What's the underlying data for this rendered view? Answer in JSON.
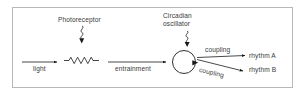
{
  "figure": {
    "type": "schematic-flow-diagram",
    "frame_border_color": "#b8b8b8",
    "background": "#ffffff",
    "stroke_color": "#1a1a1a",
    "text_color": "#3a3a3a"
  },
  "labels": {
    "photoreceptor": "Photoreceptor",
    "circadian_line1": "Circadian",
    "circadian_line2": "oscillator",
    "light": "light",
    "entrainment": "entrainment",
    "coupling_a": "coupling",
    "coupling_b": "coupling",
    "rhythm_a": "rhythm  A",
    "rhythm_b": "rhythm  B"
  },
  "nodes": [
    {
      "name": "photoreceptor",
      "kind": "squiggle-input-arrow",
      "label": "Photoreceptor"
    },
    {
      "name": "light-input",
      "kind": "arrow",
      "label": "light"
    },
    {
      "name": "transduction-zigzag",
      "kind": "sawtooth-wave"
    },
    {
      "name": "entrainment-arrow",
      "kind": "arrow",
      "label": "entrainment"
    },
    {
      "name": "circadian-oscillator",
      "kind": "circle-with-arrowhead",
      "label": "Circadian oscillator"
    },
    {
      "name": "coupling-arrow-a",
      "kind": "arrow",
      "label": "coupling"
    },
    {
      "name": "coupling-arrow-b",
      "kind": "arrow",
      "label": "coupling"
    },
    {
      "name": "rhythm-a-output",
      "kind": "output",
      "label": "rhythm  A"
    },
    {
      "name": "rhythm-b-output",
      "kind": "output",
      "label": "rhythm  B"
    }
  ]
}
